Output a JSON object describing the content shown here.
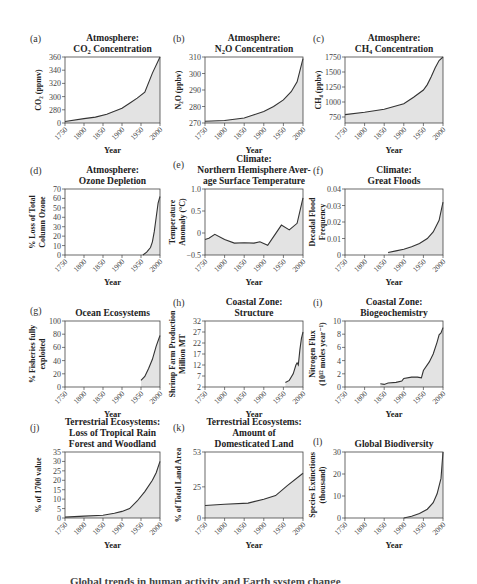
{
  "figure": {
    "caption_partial": "Global trends in human activity and Earth system change",
    "fill_color": "#e3e3e3",
    "line_color": "#333333",
    "axis_color": "#444444"
  },
  "chart_data": [
    {
      "id": "a",
      "label": "(a)",
      "type": "area",
      "title": [
        "Atmosphere:",
        "CO2 Concentration"
      ],
      "xlabel": "Year",
      "ylabel": "CO2 (ppmv)",
      "xticks": [
        1750,
        1800,
        1850,
        1900,
        1950,
        2000
      ],
      "yticks": [
        0,
        280,
        300,
        320,
        340,
        360
      ],
      "ytick_labels": [
        "0",
        "280",
        "300",
        "320",
        "340",
        "360"
      ],
      "ylim": [
        270,
        360
      ],
      "broken_axis": true,
      "x": [
        1750,
        1800,
        1830,
        1860,
        1880,
        1900,
        1920,
        1940,
        1960,
        1980,
        2000
      ],
      "values": [
        272,
        276,
        278,
        282,
        286,
        290,
        297,
        304,
        312,
        338,
        360
      ]
    },
    {
      "id": "b",
      "label": "(b)",
      "type": "area",
      "title": [
        "Atmosphere:",
        "N2O Concentration"
      ],
      "xlabel": "Year",
      "ylabel": "N2O (ppbv)",
      "xticks": [
        1750,
        1800,
        1850,
        1900,
        1950,
        2000
      ],
      "yticks": [
        270,
        280,
        290,
        300,
        310
      ],
      "ytick_labels": [
        "270",
        "280",
        "290",
        "300",
        "310"
      ],
      "ylim": [
        270,
        310
      ],
      "x": [
        1750,
        1800,
        1850,
        1875,
        1900,
        1925,
        1950,
        1970,
        1985,
        2000
      ],
      "values": [
        271,
        271.5,
        273,
        275,
        277,
        280,
        284,
        289,
        295,
        309
      ]
    },
    {
      "id": "c",
      "label": "(c)",
      "type": "area",
      "title": [
        "Atmosphere:",
        "CH4 Concentration"
      ],
      "xlabel": "Year",
      "ylabel": "CH4 (ppbv)",
      "xticks": [
        1750,
        1800,
        1850,
        1900,
        1950,
        2000
      ],
      "yticks": [
        750,
        1000,
        1250,
        1500,
        1750
      ],
      "ytick_labels": [
        "750",
        "1000",
        "1250",
        "1500",
        "1750"
      ],
      "ylim": [
        650,
        1750
      ],
      "x": [
        1750,
        1800,
        1850,
        1900,
        1925,
        1950,
        1960,
        1970,
        1980,
        1990,
        2000
      ],
      "values": [
        790,
        830,
        880,
        970,
        1080,
        1200,
        1290,
        1420,
        1570,
        1690,
        1750
      ]
    },
    {
      "id": "d",
      "label": "(d)",
      "type": "area",
      "title": [
        "Atmosphere:",
        "Ozone Depletion"
      ],
      "xlabel": "Year",
      "ylabel": "% Loss of Total Column Ozone",
      "xticks": [
        1750,
        1800,
        1850,
        1900,
        1950,
        2000
      ],
      "yticks": [
        0,
        10,
        20,
        30,
        40,
        50,
        60,
        70
      ],
      "ytick_labels": [
        "0",
        "10",
        "20",
        "30",
        "40",
        "50",
        "60",
        "70"
      ],
      "ylim": [
        0,
        70
      ],
      "x": [
        1955,
        1965,
        1975,
        1980,
        1985,
        1990,
        1995,
        2000
      ],
      "values": [
        0,
        3,
        8,
        14,
        25,
        40,
        55,
        62
      ]
    },
    {
      "id": "e",
      "label": "(e)",
      "type": "area",
      "title": [
        "Climate:",
        "Northern Hemisphere Aver-",
        "age Surface Temperature"
      ],
      "xlabel": "Year",
      "ylabel": "Temperature Anomaly (°C)",
      "xticks": [
        1750,
        1800,
        1850,
        1900,
        1950,
        2000
      ],
      "yticks": [
        -0.5,
        0,
        0.5,
        1.0
      ],
      "ytick_labels": [
        "−0.5",
        "0",
        "0.5",
        "1.0"
      ],
      "ylim": [
        -0.5,
        1.0
      ],
      "x": [
        1750,
        1760,
        1775,
        1800,
        1825,
        1850,
        1875,
        1890,
        1910,
        1945,
        1965,
        1985,
        2000
      ],
      "values": [
        -0.15,
        -0.12,
        -0.03,
        -0.15,
        -0.23,
        -0.22,
        -0.23,
        -0.2,
        -0.28,
        0.18,
        0.07,
        0.22,
        0.8
      ]
    },
    {
      "id": "f",
      "label": "(f)",
      "type": "area",
      "title": [
        "Climate:",
        "Great Floods"
      ],
      "xlabel": "Year",
      "ylabel": "Decadal Flood Frequency",
      "xticks": [
        1750,
        1800,
        1850,
        1900,
        1950,
        2000
      ],
      "yticks": [
        0,
        0.01,
        0.02,
        0.03,
        0.04
      ],
      "ytick_labels": [
        "0",
        "0.01",
        "0.02",
        "0.03",
        "0.04"
      ],
      "ylim": [
        0,
        0.04
      ],
      "x": [
        1860,
        1880,
        1900,
        1920,
        1940,
        1960,
        1975,
        1990,
        2000
      ],
      "values": [
        0.0015,
        0.0025,
        0.0035,
        0.005,
        0.007,
        0.01,
        0.014,
        0.021,
        0.032
      ]
    },
    {
      "id": "g",
      "label": "(g)",
      "type": "area",
      "title": [
        "Ocean Ecosystems"
      ],
      "xlabel": "Year",
      "ylabel": "% Fisheries fully exploited",
      "xticks": [
        1750,
        1800,
        1850,
        1900,
        1950,
        2000
      ],
      "yticks": [
        0,
        20,
        40,
        60,
        80,
        100
      ],
      "ytick_labels": [
        "0",
        "20",
        "40",
        "60",
        "80",
        "100"
      ],
      "ylim": [
        0,
        100
      ],
      "x": [
        1950,
        1960,
        1970,
        1980,
        1990,
        2000
      ],
      "values": [
        10,
        16,
        28,
        42,
        62,
        78
      ]
    },
    {
      "id": "h",
      "label": "(h)",
      "type": "area",
      "title": [
        "Coastal Zone:",
        "Structure"
      ],
      "xlabel": "Year",
      "ylabel": "Shrimp Farm Production Million MT",
      "xticks": [
        1750,
        1800,
        1850,
        1900,
        1950,
        2000
      ],
      "yticks": [
        2,
        7,
        12,
        17,
        22,
        27,
        32
      ],
      "ytick_labels": [
        "2",
        "7",
        "12",
        "17",
        "22",
        "27",
        "32"
      ],
      "ylim": [
        2,
        32
      ],
      "x": [
        1955,
        1965,
        1975,
        1982,
        1985,
        1988,
        1992,
        1996,
        2000
      ],
      "values": [
        4,
        5,
        8,
        12,
        13,
        12,
        19,
        24,
        27
      ]
    },
    {
      "id": "i",
      "label": "(i)",
      "type": "area",
      "title": [
        "Coastal Zone:",
        "Biogeochemistry"
      ],
      "xlabel": "Year",
      "ylabel": "Nitrogen Flux (10^12 moles year^-1)",
      "xticks": [
        1750,
        1800,
        1850,
        1900,
        1950,
        2000
      ],
      "yticks": [
        0,
        2,
        4,
        6,
        8,
        10
      ],
      "ytick_labels": [
        "0",
        "2",
        "4",
        "6",
        "8",
        "10"
      ],
      "ylim": [
        0,
        10
      ],
      "x": [
        1840,
        1850,
        1860,
        1880,
        1895,
        1900,
        1920,
        1935,
        1945,
        1950,
        1965,
        1975,
        1985,
        1990,
        1995,
        2000
      ],
      "values": [
        0.5,
        0.4,
        0.6,
        0.7,
        0.9,
        1.3,
        1.5,
        1.5,
        1.4,
        2.5,
        3.8,
        5,
        6.8,
        7.9,
        8.2,
        9
      ]
    },
    {
      "id": "j",
      "label": "(j)",
      "type": "area",
      "title": [
        "Terrestrial Ecosystems:",
        "Loss of Tropical Rain",
        "Forest and Woodland"
      ],
      "xlabel": "Year",
      "ylabel": "% of 1700 value",
      "xticks": [
        1750,
        1800,
        1850,
        1900,
        1950,
        2000
      ],
      "yticks": [
        0,
        5,
        10,
        15,
        20,
        25,
        30,
        35
      ],
      "ytick_labels": [
        "0",
        "5",
        "10",
        "15",
        "20",
        "25",
        "30",
        "35"
      ],
      "ylim": [
        0,
        35
      ],
      "x": [
        1750,
        1800,
        1850,
        1880,
        1900,
        1920,
        1940,
        1960,
        1980,
        1990,
        2000
      ],
      "values": [
        0.5,
        1,
        1.5,
        2.5,
        3.5,
        5,
        9,
        14,
        20,
        24,
        30
      ]
    },
    {
      "id": "k",
      "label": "(k)",
      "type": "area",
      "title": [
        "Terrestrial Ecosystems:",
        "Amount of",
        "Domesticated Land"
      ],
      "xlabel": "Year",
      "ylabel": "% of Total Land Area",
      "xticks": [
        1750,
        1800,
        1850,
        1900,
        1950,
        2000
      ],
      "yticks": [
        0,
        25,
        53
      ],
      "ytick_labels": [
        "0",
        "25",
        "53"
      ],
      "ylim": [
        0,
        53
      ],
      "x": [
        1750,
        1800,
        1860,
        1900,
        1930,
        1960,
        2000
      ],
      "values": [
        10,
        11,
        12,
        15,
        18,
        26,
        36
      ]
    },
    {
      "id": "l",
      "label": "(l)",
      "type": "area",
      "title": [
        "Global Biodiversity"
      ],
      "xlabel": "Year",
      "ylabel": "Species Extinctions (thousand)",
      "xticks": [
        1750,
        1800,
        1850,
        1900,
        1950,
        2000
      ],
      "yticks": [
        0,
        10,
        20,
        30
      ],
      "ytick_labels": [
        "0",
        "10",
        "20",
        "30"
      ],
      "ylim": [
        0,
        30
      ],
      "x": [
        1900,
        1920,
        1940,
        1960,
        1975,
        1985,
        1995,
        2000
      ],
      "values": [
        0,
        0.8,
        2,
        4,
        7,
        11,
        18,
        30
      ]
    }
  ]
}
